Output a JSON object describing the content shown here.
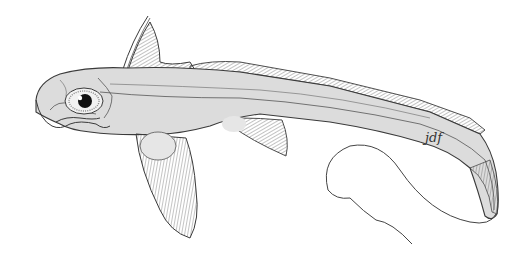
{
  "illustration": {
    "subject": "chimaera fish",
    "signature": "jdf",
    "colors": {
      "background": "#ffffff",
      "body_fill": "#dcdcdc",
      "outline": "#3a3a3a",
      "fin_rays": "#555555",
      "eye_pupil": "#111111"
    }
  }
}
